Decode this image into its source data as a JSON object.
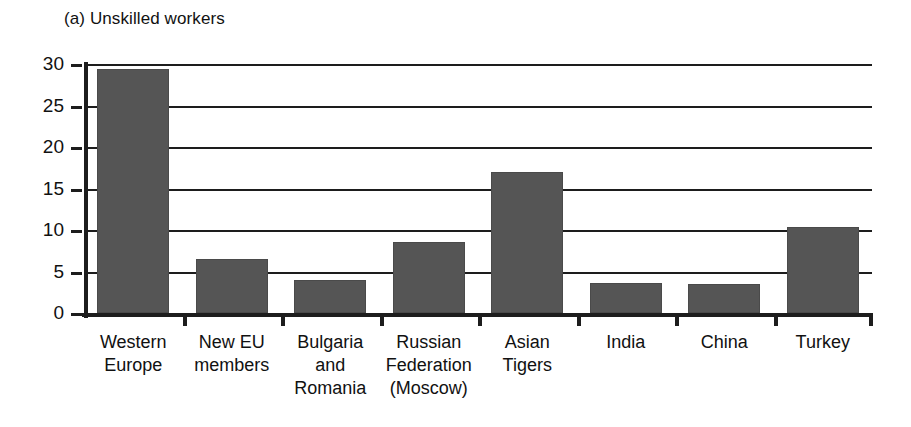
{
  "chart_data": {
    "type": "bar",
    "title": "(a) Unskilled workers",
    "xlabel": "",
    "ylabel": "",
    "ylim": [
      0,
      30
    ],
    "yticks": [
      0,
      5,
      10,
      15,
      20,
      25,
      30
    ],
    "ytick_labels": [
      "0",
      "5",
      "10",
      "15",
      "20",
      "25",
      "30"
    ],
    "grid": true,
    "legend": false,
    "legend_position": "none",
    "bar_color": "#555555",
    "axis_color": "#1d1d1d",
    "categories": [
      "Western Europe",
      "New EU members",
      "Bulgaria and Romania",
      "Russian Federation (Moscow)",
      "Asian Tigers",
      "India",
      "China",
      "Turkey"
    ],
    "category_label_lines": [
      [
        "Western",
        "Europe"
      ],
      [
        "New EU",
        "members"
      ],
      [
        "Bulgaria",
        "and",
        "Romania"
      ],
      [
        "Russian",
        "Federation",
        "(Moscow)"
      ],
      [
        "Asian",
        "Tigers"
      ],
      [
        "India"
      ],
      [
        "China"
      ],
      [
        "Turkey"
      ]
    ],
    "values": [
      29.4,
      6.5,
      4.0,
      8.6,
      17.0,
      3.6,
      3.5,
      10.4
    ]
  }
}
